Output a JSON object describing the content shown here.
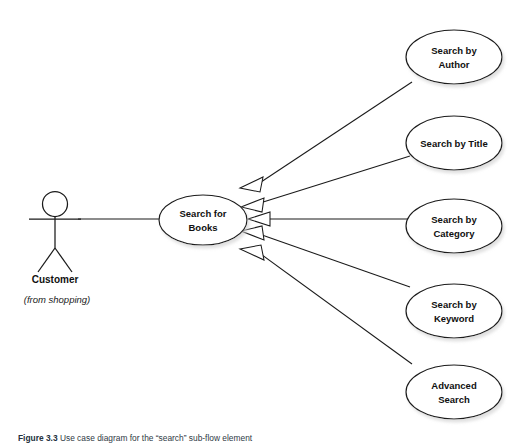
{
  "diagram": {
    "type": "uml-use-case-diagram",
    "background_color": "#ffffff",
    "stroke_color": "#1a1a1a",
    "actor": {
      "name": "Customer",
      "stereotype": "(from shopping)"
    },
    "primary_use_case": {
      "label_line1": "Search for",
      "label_line2": "Books"
    },
    "specialized_use_cases": [
      {
        "label_line1": "Search by",
        "label_line2": "Author"
      },
      {
        "label_line1": "Search by Title",
        "label_line2": ""
      },
      {
        "label_line1": "Search by",
        "label_line2": "Category"
      },
      {
        "label_line1": "Search by",
        "label_line2": "Keyword"
      },
      {
        "label_line1": "Advanced",
        "label_line2": "Search"
      }
    ],
    "relationships": {
      "association_label": "Customer to Search for Books",
      "generalization_count": 5
    }
  },
  "caption": {
    "number": "Figure 3.3",
    "text": "Use case diagram for the “search” sub-flow element"
  },
  "page_bleed": {
    "text": ""
  }
}
